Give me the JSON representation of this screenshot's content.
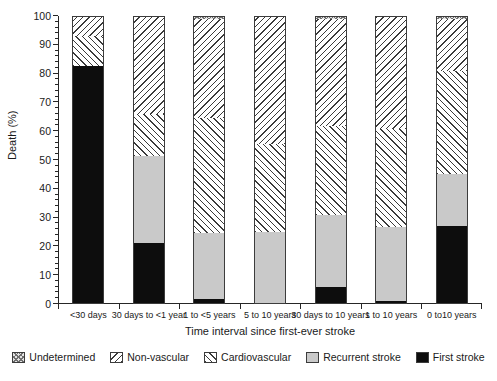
{
  "chart_data": {
    "type": "bar",
    "subtype": "stacked-bar-100-percent",
    "title": "",
    "xlabel": "Time interval since first-ever stroke",
    "ylabel": "Death (%)",
    "ylim": [
      0,
      100
    ],
    "yticks": [
      0,
      10,
      20,
      30,
      40,
      50,
      60,
      70,
      80,
      90,
      100
    ],
    "ytick_labels": [
      "0",
      "10",
      "20",
      "30",
      "40",
      "50",
      "60",
      "70",
      "80",
      "90",
      "100"
    ],
    "grid": false,
    "legend_position": "bottom",
    "stack_order_bottom_to_top": [
      "First stroke",
      "Recurrent stroke",
      "Cardiovascular",
      "Non-vascular",
      "Undetermined"
    ],
    "categories": [
      "<30 days",
      "30 days to <1 year",
      "1 to <5 years",
      "5 to 10 years",
      "30 days to 10 years",
      "1 to 10 years",
      "0 to10 years"
    ],
    "series": [
      {
        "name": "First stroke",
        "pattern": "solid-black",
        "color": "#0d0d0d",
        "values": [
          82.5,
          21.3,
          1.8,
          0.0,
          6.0,
          1.2,
          27.0
        ]
      },
      {
        "name": "Recurrent stroke",
        "pattern": "solid-light-gray",
        "color": "#c9c9c9",
        "values": [
          0.0,
          30.2,
          22.9,
          25.0,
          24.8,
          25.5,
          18.0
        ]
      },
      {
        "name": "Cardiovascular",
        "pattern": "forward-diagonal-hatch",
        "color": "#ffffff",
        "values": [
          10.5,
          14.5,
          39.8,
          30.5,
          31.0,
          34.1,
          36.0
        ]
      },
      {
        "name": "Non-vascular",
        "pattern": "backward-diagonal-hatch",
        "color": "#ffffff",
        "values": [
          7.0,
          34.0,
          34.5,
          44.5,
          37.2,
          39.2,
          18.0
        ]
      },
      {
        "name": "Undetermined",
        "pattern": "cross-hatch",
        "color": "#e3e3e3",
        "values": [
          0.0,
          0.0,
          1.0,
          0.0,
          1.0,
          0.0,
          1.0
        ]
      }
    ]
  },
  "legend": {
    "items": [
      {
        "label": "Undetermined",
        "key": "undet"
      },
      {
        "label": "Non-vascular",
        "key": "nonvasc"
      },
      {
        "label": "Cardiovascular",
        "key": "cardio"
      },
      {
        "label": "Recurrent stroke",
        "key": "recurrent"
      },
      {
        "label": "First stroke",
        "key": "first"
      }
    ]
  }
}
